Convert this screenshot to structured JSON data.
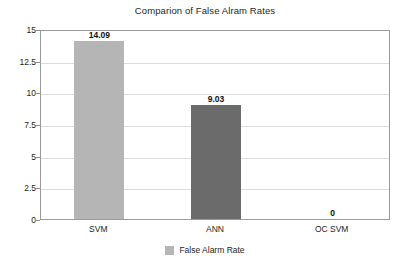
{
  "chart_data": {
    "type": "bar",
    "title": "Comparion of False Alram Rates",
    "xlabel": "",
    "ylabel": "",
    "categories": [
      "SVM",
      "ANN",
      "OC SVM"
    ],
    "values": [
      14.09,
      9.03,
      0
    ],
    "value_labels": [
      "14.09",
      "9.03",
      "0"
    ],
    "bar_colors": [
      "#b5b5b5",
      "#6b6b6b",
      "#b5b5b5"
    ],
    "ylim": [
      0,
      15
    ],
    "yticks": [
      0,
      2.5,
      5,
      7.5,
      10,
      12.5,
      15
    ],
    "ytick_labels": [
      "0",
      "2.5",
      "5",
      "7.5",
      "10",
      "12.5",
      "15"
    ],
    "grid": true,
    "grid_axis": "y",
    "legend": {
      "position": "bottom-center",
      "entries": [
        {
          "label": "False Alarm Rate",
          "color": "#b5b5b5"
        }
      ]
    },
    "series": [
      {
        "name": "False Alarm Rate",
        "values": [
          14.09,
          9.03,
          0
        ]
      }
    ]
  },
  "style": {
    "plot_background": "#ffffff",
    "page_background": "#ffffff",
    "border_color": "#9a9a9a",
    "gridline_color": "#dcdcdc",
    "text_color": "#1e1e1e"
  }
}
